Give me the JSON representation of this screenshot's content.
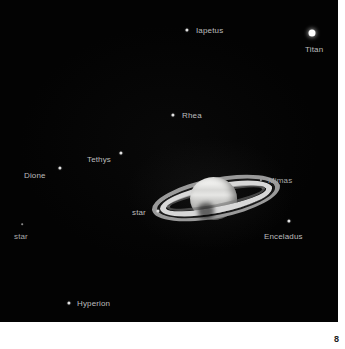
{
  "page": {
    "number": "8",
    "background_color": "#ffffff"
  },
  "photo": {
    "name": "saturn-and-moons-astrophoto",
    "background_color": "#030303",
    "label_color": "#bdbdbd",
    "planet": {
      "name": "Saturn",
      "globe_color": "#e8e8e6",
      "ring_bright_color": "#d8d8d8",
      "ring_outer_color": "#9a9a9a",
      "cassini_division_color": "#1a1a1a"
    },
    "objects": [
      {
        "id": "iapetus",
        "label": "Iapetus",
        "type": "moon",
        "brightness": "medium",
        "marker": {
          "x": 187,
          "y": 30
        },
        "label_pos": {
          "x": 196,
          "y": 26
        }
      },
      {
        "id": "titan",
        "label": "Titan",
        "type": "moon",
        "brightness": "bright",
        "marker": {
          "x": 312,
          "y": 33
        },
        "label_pos": {
          "x": 305,
          "y": 45
        }
      },
      {
        "id": "rhea",
        "label": "Rhea",
        "type": "moon",
        "brightness": "medium",
        "marker": {
          "x": 173,
          "y": 115
        },
        "label_pos": {
          "x": 182,
          "y": 111
        }
      },
      {
        "id": "tethys",
        "label": "Tethys",
        "type": "moon",
        "brightness": "medium",
        "marker": {
          "x": 121,
          "y": 153
        },
        "label_pos": {
          "x": 87,
          "y": 155
        }
      },
      {
        "id": "dione",
        "label": "Dione",
        "type": "moon",
        "brightness": "medium",
        "marker": {
          "x": 60,
          "y": 168
        },
        "label_pos": {
          "x": 24,
          "y": 171
        }
      },
      {
        "id": "mimas",
        "label": "Mimas",
        "type": "moon",
        "brightness": "faint",
        "marker": {
          "x": 261,
          "y": 180
        },
        "label_pos": {
          "x": 268,
          "y": 176
        }
      },
      {
        "id": "star-center",
        "label": "star",
        "type": "star",
        "brightness": "medium",
        "marker": {
          "x": 158,
          "y": 211
        },
        "label_pos": {
          "x": 132,
          "y": 208
        }
      },
      {
        "id": "enceladus",
        "label": "Enceladus",
        "type": "moon",
        "brightness": "medium",
        "marker": {
          "x": 289,
          "y": 221
        },
        "label_pos": {
          "x": 264,
          "y": 232
        }
      },
      {
        "id": "star-left",
        "label": "star",
        "type": "star",
        "brightness": "very-faint",
        "marker": {
          "x": 22,
          "y": 224
        },
        "label_pos": {
          "x": 14,
          "y": 232
        }
      },
      {
        "id": "hyperion",
        "label": "Hyperion",
        "type": "moon",
        "brightness": "medium",
        "marker": {
          "x": 69,
          "y": 303
        },
        "label_pos": {
          "x": 77,
          "y": 299
        }
      }
    ]
  }
}
